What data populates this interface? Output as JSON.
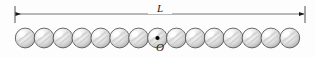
{
  "figure": {
    "kind": "physics-diagram-sphere-chain",
    "background_color": "#fdfdfd",
    "width": 315,
    "height": 57
  },
  "dimension": {
    "label": "L",
    "name": "total-length",
    "line_y": 14,
    "left_x": 15,
    "right_x": 305,
    "tick_top": 6,
    "tick_bottom": 23,
    "line_color": "#5a5a5a",
    "arrow_color": "#1a1a1a",
    "arrow_style": "double-headed"
  },
  "origin": {
    "label": "O",
    "name": "origin-marker",
    "marker": "center-dot",
    "dot_color": "#000000",
    "dot_radius": 2.1,
    "sphere_index": 7
  },
  "chain": {
    "count": 15,
    "first_center_x": 25.2,
    "spacing": 18.9,
    "center_y": 38,
    "radius": 9.9,
    "outline_color": "#4f4f4f",
    "highlight_color": "#ffffff",
    "midtone_color": "#e2e2e2",
    "shadow_color": "#a8a8a8",
    "streak_color": "#cfcfcf",
    "spheres": [
      {
        "index": 0,
        "cx": 25.2,
        "marked": false
      },
      {
        "index": 1,
        "cx": 44.1,
        "marked": false
      },
      {
        "index": 2,
        "cx": 63.0,
        "marked": false
      },
      {
        "index": 3,
        "cx": 81.9,
        "marked": false
      },
      {
        "index": 4,
        "cx": 100.8,
        "marked": false
      },
      {
        "index": 5,
        "cx": 119.7,
        "marked": false
      },
      {
        "index": 6,
        "cx": 138.6,
        "marked": false
      },
      {
        "index": 7,
        "cx": 157.5,
        "marked": true
      },
      {
        "index": 8,
        "cx": 176.4,
        "marked": false
      },
      {
        "index": 9,
        "cx": 195.3,
        "marked": false
      },
      {
        "index": 10,
        "cx": 214.2,
        "marked": false
      },
      {
        "index": 11,
        "cx": 233.1,
        "marked": false
      },
      {
        "index": 12,
        "cx": 252.0,
        "marked": false
      },
      {
        "index": 13,
        "cx": 270.9,
        "marked": false
      },
      {
        "index": 14,
        "cx": 289.8,
        "marked": false
      }
    ]
  }
}
